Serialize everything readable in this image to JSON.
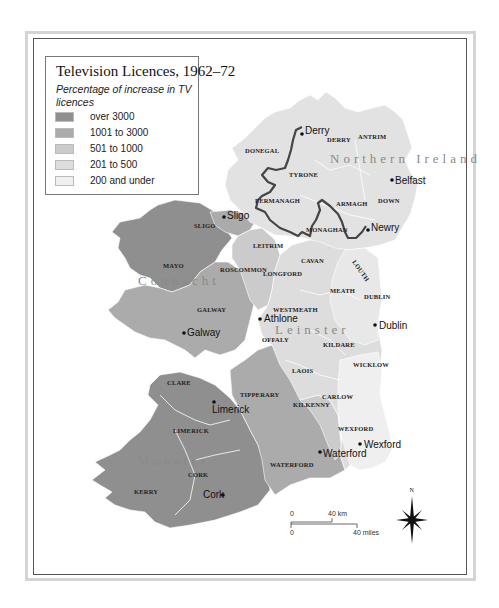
{
  "legend": {
    "title": "Television Licences, 1962–72",
    "subtitle": "Percentage of increase in TV licences",
    "items": [
      {
        "label": "over 3000",
        "color": "#8f8f8f"
      },
      {
        "label": "1001 to 3000",
        "color": "#ababab"
      },
      {
        "label": "501 to 1000",
        "color": "#cbcbcb"
      },
      {
        "label": "201 to 500",
        "color": "#dddddd"
      },
      {
        "label": "200 and under",
        "color": "#efefef"
      }
    ]
  },
  "regions": {
    "northern_ireland": "Northern Ireland",
    "connacht": "Connacht",
    "leinster": "Leinster",
    "munster": "Munster"
  },
  "counties": {
    "donegal": "DONEGAL",
    "derry": "DERRY",
    "antrim": "ANTRIM",
    "tyrone": "TYRONE",
    "fermanagh": "FERMANAGH",
    "armagh": "ARMAGH",
    "down": "DOWN",
    "monaghan": "MONAGHAN",
    "sligo": "SLIGO",
    "leitrim": "LEITRIM",
    "cavan": "CAVAN",
    "louth": "LOUTH",
    "mayo": "MAYO",
    "roscommon": "ROSCOMMON",
    "longford": "LONGFORD",
    "meath": "MEATH",
    "dublin": "DUBLIN",
    "galway": "GALWAY",
    "westmeath": "WESTMEATH",
    "offaly": "OFFALY",
    "kildare": "KILDARE",
    "laois": "LAOIS",
    "wicklow": "WICKLOW",
    "clare": "CLARE",
    "tipperary": "TIPPERARY",
    "kilkenny": "KILKENNY",
    "carlow": "CARLOW",
    "limerick": "LIMERICK",
    "wexford": "WEXFORD",
    "waterford": "WATERFORD",
    "cork": "CORK",
    "kerry": "KERRY"
  },
  "towns": {
    "derry": "Derry",
    "belfast": "Belfast",
    "newry": "Newry",
    "sligo": "Sligo",
    "athlone": "Athlone",
    "galway": "Galway",
    "dublin": "Dublin",
    "limerick": "Limerick",
    "waterford": "Waterford",
    "wexford": "Wexford",
    "cork": "Cork"
  },
  "scale": {
    "km_zero": "0",
    "km_label": "40 km",
    "mi_zero": "0",
    "mi_label": "40 miles"
  },
  "compass": {
    "north_label": "N"
  }
}
